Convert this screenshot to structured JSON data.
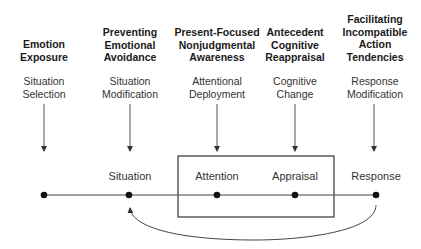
{
  "diagram": {
    "strategies": [
      {
        "label": "Emotion Exposure",
        "lines": [
          "Emotion",
          "Exposure"
        ]
      },
      {
        "label": "Preventing Emotional Avoidance",
        "lines": [
          "Preventing",
          "Emotional",
          "Avoidance"
        ]
      },
      {
        "label": "Present-Focused Nonjudgmental Awareness",
        "lines": [
          "Present-Focused",
          "Nonjudgmental",
          "Awareness"
        ]
      },
      {
        "label": "Antecedent Cognitive Reappraisal",
        "lines": [
          "Antecedent",
          "Cognitive",
          "Reappraisal"
        ]
      },
      {
        "label": "Facilitating Incompatible Action Tendencies",
        "lines": [
          "Facilitating",
          "Incompatible",
          "Action",
          "Tendencies"
        ]
      }
    ],
    "processes": [
      {
        "lines": [
          "Situation",
          "Selection"
        ]
      },
      {
        "lines": [
          "Situation",
          "Modification"
        ]
      },
      {
        "lines": [
          "Attentional",
          "Deployment"
        ]
      },
      {
        "lines": [
          "Cognitive",
          "Change"
        ]
      },
      {
        "lines": [
          "Response",
          "Modification"
        ]
      }
    ],
    "stages": [
      "Situation",
      "Attention",
      "Appraisal",
      "Response"
    ],
    "colors": {
      "line": "#333333",
      "dot": "#111111",
      "text": "#222222"
    }
  }
}
